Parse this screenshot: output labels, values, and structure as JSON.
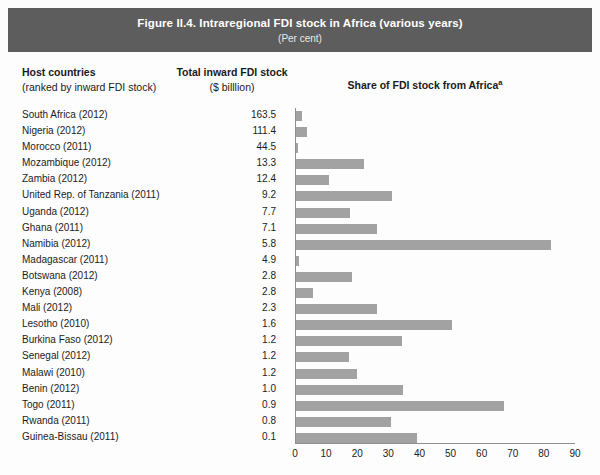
{
  "banner": {
    "title": "Figure II.4. Intraregional FDI stock in Africa (various years)",
    "subtitle": "(Per cent)",
    "bg_color": "#5d5d5d",
    "text_color": "#ffffff"
  },
  "headers": {
    "host_main": "Host countries",
    "host_sub": "(ranked by inward FDI stock)",
    "stock_main": "Total inward FDI stock",
    "stock_sub": "($ billlion)",
    "share_main": "Share of FDI stock from Africa",
    "share_note": "a"
  },
  "colors": {
    "bar": "#a2a2a2",
    "axis": "#8f8f8f",
    "text": "#1c1c1c",
    "page_bg": "#fdfdfd"
  },
  "chart_data": {
    "type": "bar",
    "title": "Figure II.4. Intraregional FDI stock in Africa (various years)",
    "subtitle": "(Per cent)",
    "orientation": "horizontal",
    "xlabel": "Share of FDI stock from Africa",
    "ylabel": "Host countries (ranked by inward FDI stock)",
    "xlim": [
      0,
      90
    ],
    "xticks": [
      0,
      10,
      20,
      30,
      40,
      50,
      60,
      70,
      80,
      90
    ],
    "grid": false,
    "legend": null,
    "categories": [
      "South Africa (2012)",
      "Nigeria (2012)",
      "Morocco (2011)",
      "Mozambique (2012)",
      "Zambia (2012)",
      "United Rep. of Tanzania (2011)",
      "Uganda (2012)",
      "Ghana (2011)",
      "Namibia (2012)",
      "Madagascar (2011)",
      "Botswana (2012)",
      "Kenya (2008)",
      "Mali (2012)",
      "Lesotho (2010)",
      "Burkina Faso (2012)",
      "Senegal (2012)",
      "Malawi (2010)",
      "Benin (2012)",
      "Togo (2011)",
      "Rwanda (2011)",
      "Guinea-Bissau (2011)"
    ],
    "series": [
      {
        "name": "Total inward FDI stock ($ billion)",
        "values": [
          163.5,
          111.4,
          44.5,
          13.3,
          12.4,
          9.2,
          7.7,
          7.1,
          5.8,
          4.9,
          2.8,
          2.8,
          2.3,
          1.6,
          1.2,
          1.2,
          1.2,
          1.0,
          0.9,
          0.8,
          0.1
        ]
      },
      {
        "name": "Share of FDI stock from Africa (per cent)",
        "values": [
          2,
          3.5,
          0.5,
          22,
          10.5,
          31,
          17.5,
          26,
          82,
          1,
          18,
          5.5,
          26,
          50,
          34,
          17,
          19.5,
          34.5,
          67,
          30.5,
          39
        ]
      }
    ],
    "rows": [
      {
        "country": "South Africa (2012)",
        "stock": "163.5",
        "share": 2
      },
      {
        "country": "Nigeria (2012)",
        "stock": "111.4",
        "share": 3.5
      },
      {
        "country": "Morocco (2011)",
        "stock": "44.5",
        "share": 0.5
      },
      {
        "country": "Mozambique (2012)",
        "stock": "13.3",
        "share": 22
      },
      {
        "country": "Zambia (2012)",
        "stock": "12.4",
        "share": 10.5
      },
      {
        "country": "United Rep. of Tanzania (2011)",
        "stock": "9.2",
        "share": 31
      },
      {
        "country": "Uganda (2012)",
        "stock": "7.7",
        "share": 17.5
      },
      {
        "country": "Ghana (2011)",
        "stock": "7.1",
        "share": 26
      },
      {
        "country": "Namibia (2012)",
        "stock": "5.8",
        "share": 82
      },
      {
        "country": "Madagascar (2011)",
        "stock": "4.9",
        "share": 1
      },
      {
        "country": "Botswana (2012)",
        "stock": "2.8",
        "share": 18
      },
      {
        "country": "Kenya (2008)",
        "stock": "2.8",
        "share": 5.5
      },
      {
        "country": "Mali (2012)",
        "stock": "2.3",
        "share": 26
      },
      {
        "country": "Lesotho (2010)",
        "stock": "1.6",
        "share": 50
      },
      {
        "country": "Burkina Faso (2012)",
        "stock": "1.2",
        "share": 34
      },
      {
        "country": "Senegal (2012)",
        "stock": "1.2",
        "share": 17
      },
      {
        "country": "Malawi (2010)",
        "stock": "1.2",
        "share": 19.5
      },
      {
        "country": "Benin (2012)",
        "stock": "1.0",
        "share": 34.5
      },
      {
        "country": "Togo (2011)",
        "stock": "0.9",
        "share": 67
      },
      {
        "country": "Rwanda (2011)",
        "stock": "0.8",
        "share": 30.5
      },
      {
        "country": "Guinea-Bissau (2011)",
        "stock": "0.1",
        "share": 39
      }
    ]
  }
}
